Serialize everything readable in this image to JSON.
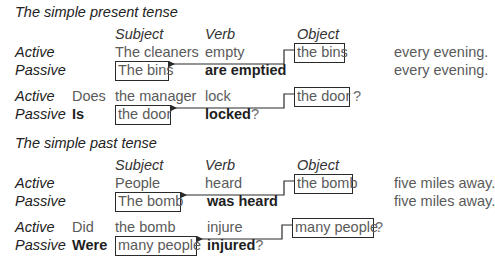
{
  "sections": [
    {
      "title": "The simple present tense",
      "headers": {
        "subject": "Subject",
        "verb": "Verb",
        "object": "Object"
      },
      "pairs": [
        {
          "active": {
            "label": "Active",
            "aux": "",
            "subject": "The cleaners",
            "verb": "empty",
            "object": "the bins",
            "object_suffix": "",
            "tail": "every evening."
          },
          "passive": {
            "label": "Passive",
            "aux": "",
            "subject": "The bins",
            "verb": "are emptied",
            "verb_suffix": "",
            "tail": "every evening."
          }
        },
        {
          "active": {
            "label": "Active",
            "aux": "Does",
            "subject": "the manager",
            "verb": "lock",
            "object": "the door",
            "object_suffix": "?",
            "tail": ""
          },
          "passive": {
            "label": "Passive",
            "aux": "Is",
            "subject": "the door",
            "verb": "locked",
            "verb_suffix": "?",
            "tail": ""
          }
        }
      ]
    },
    {
      "title": "The simple past tense",
      "headers": {
        "subject": "Subject",
        "verb": "Verb",
        "object": "Object"
      },
      "pairs": [
        {
          "active": {
            "label": "Active",
            "aux": "",
            "subject": "People",
            "verb": "heard",
            "object": "the bomb",
            "object_suffix": "",
            "tail": "five miles away."
          },
          "passive": {
            "label": "Passive",
            "aux": "",
            "subject": "The bomb",
            "verb": "was heard",
            "verb_suffix": "",
            "tail": "five miles away."
          }
        },
        {
          "active": {
            "label": "Active",
            "aux": "Did",
            "subject": "the bomb",
            "verb": "injure",
            "object": "many people",
            "object_suffix": "?",
            "tail": ""
          },
          "passive": {
            "label": "Passive",
            "aux": "Were",
            "subject": "many people",
            "verb": "injured",
            "verb_suffix": "?",
            "tail": ""
          }
        }
      ]
    }
  ],
  "colors": {
    "line": "#2a2a2a",
    "text": "#5a5a5a",
    "bold": "#1e1e1e"
  }
}
